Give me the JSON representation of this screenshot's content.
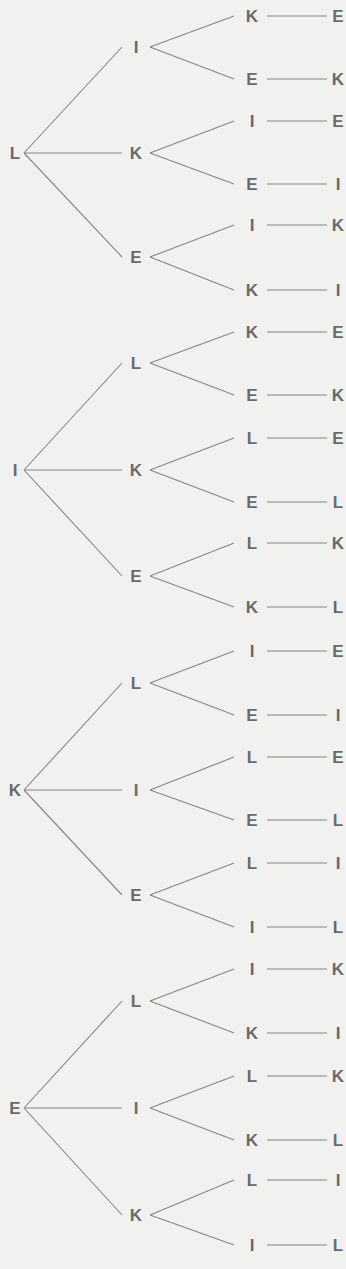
{
  "diagram": {
    "title": "",
    "type": "tree",
    "colors": {
      "background": "#f1f1ef",
      "text": "#6a6a6a",
      "line": "#858585"
    },
    "trees": [
      {
        "root": "L",
        "root_y": 153,
        "children": [
          {
            "label": "I",
            "y": 47,
            "children": [
              {
                "label": "K",
                "y": 16,
                "leaf": "E"
              },
              {
                "label": "E",
                "y": 79,
                "leaf": "K"
              }
            ]
          },
          {
            "label": "K",
            "y": 153,
            "children": [
              {
                "label": "I",
                "y": 121,
                "leaf": "E"
              },
              {
                "label": "E",
                "y": 184,
                "leaf": "I"
              }
            ]
          },
          {
            "label": "E",
            "y": 257,
            "children": [
              {
                "label": "I",
                "y": 225,
                "leaf": "K"
              },
              {
                "label": "K",
                "y": 290,
                "leaf": "I"
              }
            ]
          }
        ]
      },
      {
        "root": "I",
        "root_y": 470,
        "children": [
          {
            "label": "L",
            "y": 363,
            "children": [
              {
                "label": "K",
                "y": 332,
                "leaf": "E"
              },
              {
                "label": "E",
                "y": 395,
                "leaf": "K"
              }
            ]
          },
          {
            "label": "K",
            "y": 470,
            "children": [
              {
                "label": "L",
                "y": 438,
                "leaf": "E"
              },
              {
                "label": "E",
                "y": 502,
                "leaf": "L"
              }
            ]
          },
          {
            "label": "E",
            "y": 576,
            "children": [
              {
                "label": "L",
                "y": 543,
                "leaf": "K"
              },
              {
                "label": "K",
                "y": 607,
                "leaf": "L"
              }
            ]
          }
        ]
      },
      {
        "root": "K",
        "root_y": 790,
        "children": [
          {
            "label": "L",
            "y": 683,
            "children": [
              {
                "label": "I",
                "y": 651,
                "leaf": "E"
              },
              {
                "label": "E",
                "y": 715,
                "leaf": "I"
              }
            ]
          },
          {
            "label": "I",
            "y": 790,
            "children": [
              {
                "label": "L",
                "y": 757,
                "leaf": "E"
              },
              {
                "label": "E",
                "y": 820,
                "leaf": "L"
              }
            ]
          },
          {
            "label": "E",
            "y": 895,
            "children": [
              {
                "label": "L",
                "y": 863,
                "leaf": "I"
              },
              {
                "label": "I",
                "y": 927,
                "leaf": "L"
              }
            ]
          }
        ]
      },
      {
        "root": "E",
        "root_y": 1108,
        "children": [
          {
            "label": "L",
            "y": 1001,
            "children": [
              {
                "label": "I",
                "y": 969,
                "leaf": "K"
              },
              {
                "label": "K",
                "y": 1033,
                "leaf": "I"
              }
            ]
          },
          {
            "label": "I",
            "y": 1108,
            "children": [
              {
                "label": "L",
                "y": 1076,
                "leaf": "K"
              },
              {
                "label": "K",
                "y": 1140,
                "leaf": "L"
              }
            ]
          },
          {
            "label": "K",
            "y": 1215,
            "children": [
              {
                "label": "L",
                "y": 1180,
                "leaf": "I"
              },
              {
                "label": "I",
                "y": 1245,
                "leaf": "L"
              }
            ]
          }
        ]
      }
    ]
  }
}
